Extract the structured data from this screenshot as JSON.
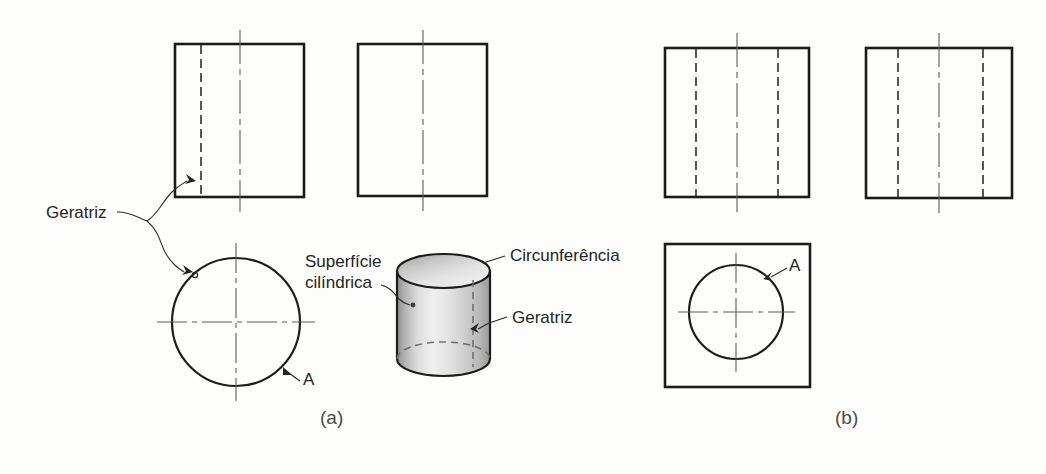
{
  "figure": {
    "background_color": "#fdfdfc",
    "line_color": "#1b1b1b",
    "text_color": "#242424"
  },
  "panels": [
    {
      "id": "a",
      "caption": "(a)",
      "caption_x": 320,
      "caption_y": 424
    },
    {
      "id": "b",
      "caption": "(b)",
      "caption_x": 835,
      "caption_y": 424
    }
  ],
  "labels": {
    "geratriz_left": "Geratriz",
    "superficie_line1": "Superfície",
    "superficie_line2": "cilíndrica",
    "circunferencia": "Circunferência",
    "geratriz_cylinder": "Geratriz",
    "marker_a_circle": "A",
    "marker_a_square": "A"
  },
  "views": {
    "panel_a": {
      "front_view": {
        "name": "vista frontal com geratriz",
        "x": 175,
        "y": 44,
        "width": 129,
        "height": 153,
        "hidden_generatrix_x": 201,
        "centerline_x": 240
      },
      "side_view": {
        "name": "vista lateral",
        "x": 358,
        "y": 44,
        "width": 129,
        "height": 152,
        "centerline_x": 423
      },
      "top_view": {
        "name": "vista superior circular",
        "center_x": 236,
        "center_y": 322,
        "radius": 64
      },
      "pictorial": {
        "name": "cilindro em perspectiva",
        "x": 397,
        "y": 255,
        "width": 93,
        "height": 120
      }
    },
    "panel_b": {
      "front_view": {
        "name": "vista frontal com furo",
        "x": 665,
        "y": 48,
        "width": 144,
        "height": 149,
        "hidden_left_x": 696,
        "hidden_right_x": 778,
        "centerline_x": 737
      },
      "side_view": {
        "name": "vista lateral com furo",
        "x": 866,
        "y": 48,
        "width": 146,
        "height": 150,
        "hidden_left_x": 898,
        "hidden_right_x": 983,
        "centerline_x": 939
      },
      "top_view": {
        "name": "vista superior quadrada com circunferencia",
        "x": 665,
        "y": 244,
        "width": 145,
        "height": 143,
        "circle_center_x": 736,
        "circle_center_y": 312,
        "circle_radius": 47
      }
    }
  }
}
